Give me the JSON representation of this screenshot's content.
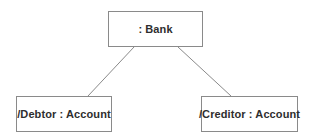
{
  "diagram": {
    "kind": "uml-object-diagram",
    "width": 310,
    "height": 139,
    "background_color": "#ffffff",
    "border_color": "#8a8a8a",
    "text_color": "#2e2e2e",
    "line_color": "#8a8a8a",
    "nodes": [
      {
        "id": "bank",
        "label": ": Bank",
        "x": 108,
        "y": 11,
        "width": 95,
        "height": 36
      },
      {
        "id": "debtor",
        "label": "/Debtor : Account",
        "x": 16,
        "y": 96,
        "width": 96,
        "height": 36
      },
      {
        "id": "creditor",
        "label": "/Creditor : Account",
        "x": 201,
        "y": 96,
        "width": 97,
        "height": 36
      }
    ],
    "links": [
      {
        "id": "bank-debtor",
        "from": "bank",
        "to": "debtor",
        "x1": 134,
        "y1": 47,
        "x2": 88,
        "y2": 96
      },
      {
        "id": "bank-creditor",
        "from": "bank",
        "to": "creditor",
        "x1": 178,
        "y1": 47,
        "x2": 231,
        "y2": 96
      }
    ]
  }
}
